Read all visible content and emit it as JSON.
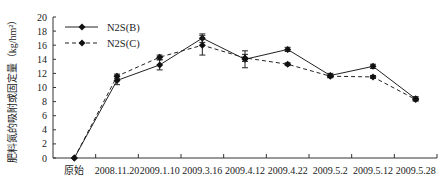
{
  "chart_data": {
    "type": "line",
    "title": "",
    "xlabel": "",
    "ylabel": "肥料氮的吸附或固定量（kg/hm²）",
    "ylim": [
      0,
      20
    ],
    "yticks": [
      0,
      2,
      4,
      6,
      8,
      10,
      12,
      14,
      16,
      18,
      20
    ],
    "grid": false,
    "legend_position": "upper-left",
    "categories": [
      "原始",
      "2008.11.20",
      "2009.1.10",
      "2009.3.16",
      "2009.4.12",
      "2009.4.22",
      "2009.5.2",
      "2009.5.12",
      "2009.5.28"
    ],
    "series": [
      {
        "name": "N2S(B)",
        "line_style": "solid",
        "marker": "diamond",
        "color": "#222222",
        "values": [
          0,
          11.0,
          13.2,
          17.0,
          14.0,
          15.4,
          11.7,
          13.0,
          8.4
        ],
        "errors": [
          0,
          0.6,
          0.7,
          0.6,
          1.2,
          0.3,
          0.3,
          0.3,
          0.3
        ]
      },
      {
        "name": "N2S(C)",
        "line_style": "dashed",
        "marker": "diamond",
        "color": "#222222",
        "values": [
          0,
          11.6,
          14.3,
          16.0,
          14.2,
          13.3,
          11.6,
          11.5,
          8.3
        ],
        "errors": [
          0,
          0.3,
          0.3,
          1.4,
          0.5,
          0.2,
          0.2,
          0.2,
          0.2
        ]
      }
    ]
  }
}
